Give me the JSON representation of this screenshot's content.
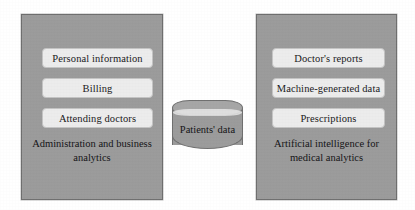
{
  "figure": {
    "type": "block-diagram",
    "background_color": "#ffffff",
    "panel_color": "#9b9b9b",
    "panel_border_color": "#6f6f6f",
    "chip_color": "#ececec",
    "chip_border_color": "#c4c4c4",
    "text_color": "#141316"
  },
  "left_panel": {
    "caption": "Administration and business analytics",
    "items": [
      {
        "label": "Personal information"
      },
      {
        "label": "Billing"
      },
      {
        "label": "Attending doctors"
      }
    ]
  },
  "center": {
    "store_label": "Patients' data",
    "shape": "cylinder-database"
  },
  "right_panel": {
    "caption": "Artificial intelligence for medical analytics",
    "items": [
      {
        "label": "Doctor's reports"
      },
      {
        "label": "Machine-generated data"
      },
      {
        "label": "Prescriptions"
      }
    ]
  }
}
